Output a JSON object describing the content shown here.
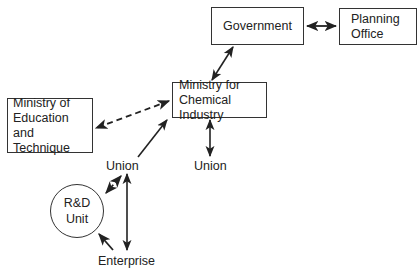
{
  "diagram": {
    "nodes": {
      "government": {
        "label": "Government"
      },
      "planning_office": {
        "lines": [
          "Planning",
          "Office"
        ]
      },
      "ministry_chemical": {
        "lines": [
          "Ministry for",
          "Chemical Industry"
        ]
      },
      "ministry_education": {
        "lines": [
          "Ministry of",
          "Education and",
          "Technique"
        ]
      },
      "union_left": {
        "label": "Union"
      },
      "union_right": {
        "label": "Union"
      },
      "rd_unit": {
        "lines": [
          "R&D",
          "Unit"
        ]
      },
      "enterprise": {
        "label": "Enterprise"
      }
    },
    "edges": [
      {
        "from": "government",
        "to": "planning_office",
        "style": "solid",
        "direction": "both"
      },
      {
        "from": "government",
        "to": "ministry_chemical",
        "style": "solid",
        "direction": "both"
      },
      {
        "from": "ministry_chemical",
        "to": "ministry_education",
        "style": "dashed",
        "direction": "both"
      },
      {
        "from": "union_left",
        "to": "ministry_chemical",
        "style": "solid",
        "direction": "forward"
      },
      {
        "from": "ministry_chemical",
        "to": "union_right",
        "style": "solid",
        "direction": "both"
      },
      {
        "from": "rd_unit",
        "to": "union_left",
        "style": "dashed",
        "direction": "both"
      },
      {
        "from": "enterprise",
        "to": "union_left",
        "style": "solid",
        "direction": "both"
      },
      {
        "from": "enterprise",
        "to": "rd_unit",
        "style": "solid",
        "direction": "forward"
      }
    ],
    "colors": {
      "stroke": "#222222",
      "background": "#ffffff"
    }
  }
}
